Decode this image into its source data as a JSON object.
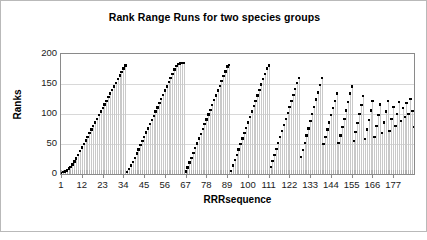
{
  "chart_data": {
    "type": "scatter",
    "title": "Rank Range Runs for two species groups",
    "xlabel": "RRRsequence",
    "ylabel": "Ranks",
    "xlim": [
      1,
      188
    ],
    "ylim": [
      0,
      200
    ],
    "yticks": [
      0,
      50,
      100,
      150,
      200
    ],
    "xticks": [
      1,
      12,
      23,
      34,
      45,
      56,
      67,
      78,
      89,
      100,
      111,
      122,
      133,
      144,
      155,
      166,
      177
    ],
    "grid": true,
    "legend": "none",
    "marker_color": "#000000",
    "range_bar_color": "#c9c9c9",
    "series": [
      {
        "name": "Rank",
        "marker": "square",
        "x": [
          1,
          2,
          3,
          4,
          5,
          6,
          7,
          8,
          9,
          10,
          11,
          12,
          13,
          14,
          15,
          16,
          17,
          18,
          19,
          20,
          21,
          22,
          23,
          24,
          25,
          26,
          27,
          28,
          29,
          30,
          31,
          32,
          33,
          34,
          35,
          36,
          37,
          38,
          39,
          40,
          41,
          42,
          43,
          44,
          45,
          46,
          47,
          48,
          49,
          50,
          51,
          52,
          53,
          54,
          55,
          56,
          57,
          58,
          59,
          60,
          61,
          62,
          63,
          64,
          65,
          66,
          67,
          68,
          69,
          70,
          71,
          72,
          73,
          74,
          75,
          76,
          77,
          78,
          79,
          80,
          81,
          82,
          83,
          84,
          85,
          86,
          87,
          88,
          89,
          90,
          91,
          92,
          93,
          94,
          95,
          96,
          97,
          98,
          99,
          100,
          101,
          102,
          103,
          104,
          105,
          106,
          107,
          108,
          109,
          110,
          111,
          112,
          113,
          114,
          115,
          116,
          117,
          118,
          119,
          120,
          121,
          122,
          123,
          124,
          125,
          126,
          127,
          128,
          129,
          130,
          131,
          132,
          133,
          134,
          135,
          136,
          137,
          138,
          139,
          140,
          141,
          142,
          143,
          144,
          145,
          146,
          147,
          148,
          149,
          150,
          151,
          152,
          153,
          154,
          155,
          156,
          157,
          158,
          159,
          160,
          161,
          162,
          163,
          164,
          165,
          166,
          167,
          168,
          169,
          170,
          171,
          172,
          173,
          174,
          175,
          176,
          177,
          178,
          179,
          180,
          181,
          182,
          183,
          184,
          185,
          186,
          187,
          188
        ],
        "values": [
          2,
          3,
          4,
          6,
          9,
          12,
          16,
          21,
          26,
          32,
          38,
          44,
          50,
          56,
          62,
          68,
          74,
          80,
          86,
          92,
          98,
          104,
          110,
          116,
          122,
          128,
          134,
          140,
          146,
          152,
          158,
          164,
          170,
          176,
          181,
          3,
          8,
          14,
          20,
          27,
          34,
          41,
          48,
          55,
          62,
          69,
          76,
          83,
          90,
          97,
          104,
          111,
          118,
          125,
          132,
          139,
          146,
          153,
          160,
          167,
          174,
          180,
          183,
          184,
          185,
          185,
          4,
          11,
          19,
          27,
          35,
          43,
          51,
          59,
          67,
          75,
          83,
          91,
          99,
          107,
          115,
          123,
          131,
          139,
          147,
          155,
          163,
          171,
          179,
          182,
          5,
          14,
          23,
          32,
          41,
          50,
          59,
          68,
          77,
          86,
          95,
          104,
          113,
          122,
          131,
          140,
          149,
          158,
          167,
          176,
          181,
          12,
          22,
          32,
          42,
          52,
          62,
          72,
          82,
          92,
          102,
          112,
          122,
          132,
          142,
          152,
          160,
          28,
          40,
          52,
          64,
          76,
          88,
          100,
          112,
          124,
          136,
          148,
          160,
          50,
          62,
          74,
          86,
          98,
          110,
          122,
          134,
          52,
          64,
          78,
          92,
          106,
          120,
          134,
          146,
          55,
          70,
          85,
          100,
          115,
          130,
          58,
          74,
          90,
          106,
          122,
          62,
          80,
          98,
          116,
          68,
          86,
          104,
          122,
          72,
          92,
          112,
          80,
          100,
          120,
          88,
          110,
          95,
          118,
          100,
          125,
          105,
          78
        ]
      },
      {
        "name": "RangeLow",
        "x": [
          1,
          2,
          3,
          4,
          5,
          6,
          7,
          8,
          9,
          10,
          11,
          12,
          13,
          14,
          15,
          16,
          17,
          18,
          19,
          20,
          21,
          22,
          23,
          24,
          25,
          26,
          27,
          28,
          29,
          30,
          31,
          32,
          33,
          34,
          35,
          36,
          37,
          38,
          39,
          40,
          41,
          42,
          43,
          44,
          45,
          46,
          47,
          48,
          49,
          50,
          51,
          52,
          53,
          54,
          55,
          56,
          57,
          58,
          59,
          60,
          61,
          62,
          63,
          64,
          65,
          66,
          67,
          68,
          69,
          70,
          71,
          72,
          73,
          74,
          75,
          76,
          77,
          78,
          79,
          80,
          81,
          82,
          83,
          84,
          85,
          86,
          87,
          88,
          89,
          90,
          91,
          92,
          93,
          94,
          95,
          96,
          97,
          98,
          99,
          100,
          101,
          102,
          103,
          104,
          105,
          106,
          107,
          108,
          109,
          110,
          111,
          112,
          113,
          114,
          115,
          116,
          117,
          118,
          119,
          120,
          121,
          122,
          123,
          124,
          125,
          126,
          127,
          128,
          129,
          130,
          131,
          132,
          133,
          134,
          135,
          136,
          137,
          138,
          139,
          140,
          141,
          142,
          143,
          144,
          145,
          146,
          147,
          148,
          149,
          150,
          151,
          152,
          153,
          154,
          155,
          156,
          157,
          158,
          159,
          160,
          161,
          162,
          163,
          164,
          165,
          166,
          167,
          168,
          169,
          170,
          171,
          172,
          173,
          174,
          175,
          176,
          177,
          178,
          179,
          180,
          181,
          182,
          183,
          184,
          185,
          186,
          187,
          188
        ],
        "values": [
          0,
          0,
          0,
          0,
          0,
          0,
          0,
          0,
          0,
          0,
          0,
          0,
          0,
          0,
          0,
          0,
          0,
          0,
          0,
          0,
          0,
          0,
          0,
          0,
          0,
          0,
          0,
          0,
          0,
          0,
          0,
          0,
          0,
          0,
          0,
          0,
          0,
          0,
          0,
          0,
          0,
          0,
          0,
          0,
          0,
          0,
          0,
          0,
          0,
          0,
          0,
          0,
          0,
          0,
          0,
          0,
          0,
          0,
          0,
          0,
          0,
          0,
          0,
          0,
          0,
          0,
          0,
          0,
          0,
          0,
          0,
          0,
          0,
          0,
          0,
          0,
          0,
          0,
          0,
          0,
          0,
          0,
          0,
          0,
          0,
          0,
          0,
          0,
          0,
          0,
          0,
          0,
          0,
          0,
          0,
          0,
          0,
          0,
          0,
          0,
          0,
          0,
          0,
          0,
          0,
          0,
          0,
          0,
          0,
          0,
          0,
          0,
          0,
          0,
          0,
          0,
          0,
          0,
          0,
          0,
          0,
          0,
          0,
          0,
          0,
          0,
          0,
          0,
          0,
          0,
          0,
          0,
          0,
          0,
          0,
          0,
          0,
          0,
          0,
          0,
          0,
          0,
          0,
          0,
          0,
          0,
          0,
          0,
          0,
          0,
          0,
          0,
          0,
          0,
          0,
          0,
          0,
          0,
          0,
          0,
          0,
          0,
          0,
          0,
          0,
          0,
          0,
          0,
          0,
          0,
          0,
          0,
          0,
          0,
          0,
          0,
          0,
          0,
          0,
          0,
          0,
          0,
          0,
          0,
          0,
          0,
          0,
          0
        ]
      }
    ]
  }
}
